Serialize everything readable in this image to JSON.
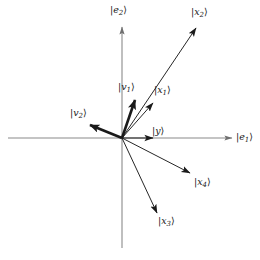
{
  "figure": {
    "background_color": "#ffffff",
    "width": 260,
    "height": 260,
    "origin": {
      "x": 122,
      "y": 138
    },
    "axis_color": "#8a8a8a",
    "vector_color": "#1a1a1a"
  },
  "axes": [
    {
      "name": "horizontal-axis",
      "label": "|e₁⟩",
      "label_base": "e",
      "label_sub": "1",
      "x1": 8,
      "y1": 138,
      "x2": 232,
      "y2": 138,
      "arrow_head": true,
      "label_x": 236,
      "label_y": 132
    },
    {
      "name": "vertical-axis",
      "label": "|e₂⟩",
      "label_base": "e",
      "label_sub": "2",
      "x1": 122,
      "y1": 248,
      "x2": 122,
      "y2": 27,
      "arrow_head": true,
      "label_x": 110,
      "label_y": 5
    }
  ],
  "vectors": [
    {
      "name": "vector-x2",
      "label_base": "x",
      "label_sub": "2",
      "label": "|x₂⟩",
      "x1": 122,
      "y1": 138,
      "x2": 196,
      "y2": 28,
      "weight": "thin",
      "label_x": 191,
      "label_y": 7
    },
    {
      "name": "vector-x1",
      "label_base": "x",
      "label_sub": "1",
      "label": "|x₁⟩",
      "x1": 122,
      "y1": 138,
      "x2": 153,
      "y2": 103,
      "weight": "thin",
      "label_x": 154,
      "label_y": 85
    },
    {
      "name": "vector-v1",
      "label_base": "v",
      "label_sub": "1",
      "label": "|v₁⟩",
      "x1": 122,
      "y1": 138,
      "x2": 135,
      "y2": 100,
      "weight": "thick",
      "label_x": 118,
      "label_y": 82
    },
    {
      "name": "vector-v2",
      "label_base": "v",
      "label_sub": "2",
      "label": "|v₂⟩",
      "x1": 122,
      "y1": 138,
      "x2": 90,
      "y2": 125,
      "weight": "thick",
      "label_x": 70,
      "label_y": 108
    },
    {
      "name": "vector-y",
      "label_base": "y",
      "label_sub": "",
      "label": "|y⟩",
      "x1": 122,
      "y1": 138,
      "x2": 153,
      "y2": 138,
      "weight": "thin",
      "label_x": 152,
      "label_y": 126
    },
    {
      "name": "vector-x4",
      "label_base": "x",
      "label_sub": "4",
      "label": "|x₄⟩",
      "x1": 122,
      "y1": 138,
      "x2": 190,
      "y2": 173,
      "weight": "thin",
      "label_x": 194,
      "label_y": 177
    },
    {
      "name": "vector-x3",
      "label_base": "x",
      "label_sub": "3",
      "label": "|x₃⟩",
      "x1": 122,
      "y1": 138,
      "x2": 157,
      "y2": 213,
      "weight": "thin",
      "label_x": 158,
      "label_y": 216
    }
  ]
}
